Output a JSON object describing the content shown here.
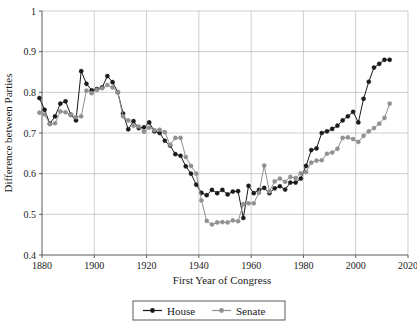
{
  "chart_data": {
    "type": "line",
    "title": "",
    "xlabel": "First Year of Congress",
    "ylabel": "Difference between Parties",
    "xlim": [
      1880,
      2020
    ],
    "ylim": [
      0.4,
      1.0
    ],
    "xticks": [
      1880,
      1900,
      1920,
      1940,
      1960,
      1980,
      2000,
      2020
    ],
    "xtick_labels": [
      "1880",
      "1900",
      "1920",
      "1940",
      "1960",
      "1980",
      "2000",
      "2020"
    ],
    "yticks": [
      0.4,
      0.5,
      0.6,
      0.7,
      0.8,
      0.9,
      1.0
    ],
    "ytick_labels": [
      "0.4",
      "0.5",
      "0.6",
      "0.7",
      "0.8",
      "0.9",
      "1"
    ],
    "grid": true,
    "legend_position": "bottom-center",
    "marker": "circle",
    "x": [
      1879,
      1881,
      1883,
      1885,
      1887,
      1889,
      1891,
      1893,
      1895,
      1897,
      1899,
      1901,
      1903,
      1905,
      1907,
      1909,
      1911,
      1913,
      1915,
      1917,
      1919,
      1921,
      1923,
      1925,
      1927,
      1929,
      1931,
      1933,
      1935,
      1937,
      1939,
      1941,
      1943,
      1945,
      1947,
      1949,
      1951,
      1953,
      1955,
      1957,
      1959,
      1961,
      1963,
      1965,
      1967,
      1969,
      1971,
      1973,
      1975,
      1977,
      1979,
      1981,
      1983,
      1985,
      1987,
      1989,
      1991,
      1993,
      1995,
      1997,
      1999,
      2001,
      2003,
      2005,
      2007,
      2009,
      2011,
      2013
    ],
    "series": [
      {
        "name": "House",
        "color": "#1a1a1a",
        "values": [
          0.786,
          0.757,
          0.723,
          0.741,
          0.772,
          0.778,
          0.745,
          0.731,
          0.852,
          0.821,
          0.805,
          0.808,
          0.812,
          0.84,
          0.825,
          0.8,
          0.748,
          0.709,
          0.729,
          0.712,
          0.714,
          0.726,
          0.704,
          0.7,
          0.681,
          0.669,
          0.648,
          0.644,
          0.618,
          0.6,
          0.573,
          0.553,
          0.547,
          0.56,
          0.552,
          0.56,
          0.549,
          0.556,
          0.557,
          0.491,
          0.57,
          0.552,
          0.56,
          0.565,
          0.552,
          0.564,
          0.569,
          0.561,
          0.578,
          0.578,
          0.588,
          0.619,
          0.658,
          0.662,
          0.7,
          0.704,
          0.71,
          0.718,
          0.731,
          0.741,
          0.752,
          0.726,
          0.784,
          0.826,
          0.861,
          0.87,
          0.88,
          0.88
        ]
      },
      {
        "name": "Senate",
        "color": "#909090",
        "values": [
          0.75,
          0.746,
          0.722,
          0.724,
          0.753,
          0.751,
          0.745,
          0.739,
          0.741,
          0.804,
          0.798,
          0.806,
          0.81,
          0.818,
          0.812,
          0.8,
          0.741,
          0.731,
          0.718,
          0.716,
          0.703,
          0.713,
          0.707,
          0.708,
          0.702,
          0.671,
          0.688,
          0.688,
          0.641,
          0.619,
          0.6,
          0.534,
          0.484,
          0.475,
          0.48,
          0.481,
          0.48,
          0.485,
          0.483,
          0.525,
          0.527,
          0.527,
          0.553,
          0.62,
          0.556,
          0.581,
          0.588,
          0.58,
          0.592,
          0.589,
          0.601,
          0.604,
          0.627,
          0.632,
          0.633,
          0.649,
          0.652,
          0.661,
          0.688,
          0.689,
          0.685,
          0.678,
          0.693,
          0.704,
          0.712,
          0.723,
          0.737,
          0.772
        ]
      }
    ]
  },
  "legend": {
    "items": [
      {
        "label": "House",
        "color": "#1a1a1a"
      },
      {
        "label": "Senate",
        "color": "#909090"
      }
    ]
  }
}
